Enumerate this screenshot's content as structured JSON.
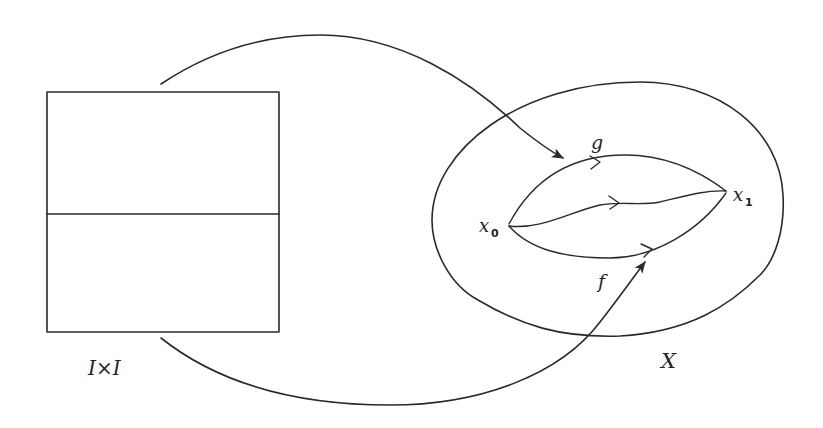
{
  "figure": {
    "labels": {
      "domain_square": "I×I",
      "space": "X",
      "path_top": "g",
      "path_bottom": "f",
      "start_point_base": "x",
      "start_point_sub": "0",
      "end_point_base": "x",
      "end_point_sub": "1"
    },
    "colors": {
      "stroke": "#2a2a2a",
      "background": "#ffffff"
    }
  }
}
